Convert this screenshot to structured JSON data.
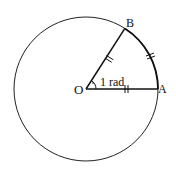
{
  "diagram": {
    "type": "radian-definition",
    "circle": {
      "cx": 86,
      "cy": 89,
      "r": 72,
      "stroke": "#222222"
    },
    "points": {
      "O": {
        "label": "O",
        "x": 86,
        "y": 89
      },
      "A": {
        "label": "A",
        "x": 158,
        "y": 89
      },
      "B": {
        "label": "B",
        "x": 125,
        "y": 28
      }
    },
    "angle_label": "1 rad",
    "equal_marks": [
      "OA",
      "OB",
      "arc AB"
    ]
  }
}
